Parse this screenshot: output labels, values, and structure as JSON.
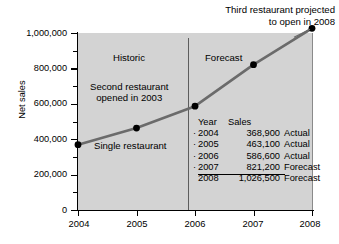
{
  "chart_data": {
    "type": "line",
    "title": "",
    "xlabel": "",
    "ylabel": "Net sales",
    "x": [
      "2004",
      "2005",
      "2006",
      "2007",
      "2008"
    ],
    "categories": [
      "2004",
      "2005",
      "2006",
      "2007",
      "2008"
    ],
    "values": [
      368900,
      463100,
      586600,
      821200,
      1026500
    ],
    "series": [
      {
        "name": "Net sales",
        "values": [
          368900,
          463100,
          586600,
          821200,
          1026500
        ]
      }
    ],
    "ylim": [
      0,
      1000000
    ],
    "y_ticks": [
      0,
      200000,
      400000,
      600000,
      800000,
      1000000
    ],
    "y_tick_labels": [
      "0",
      "200,000",
      "400,000",
      "600,000",
      "800,000",
      "1,000,000"
    ],
    "y_minor_tick_interval": 100000,
    "x_tick_labels": [
      "2004",
      "2005",
      "2006",
      "2007",
      "2008"
    ],
    "grid": false,
    "legend": "none",
    "marker": "filled-circle",
    "line_color": "#6b6b6b",
    "marker_color": "#000000",
    "plot_background": "#d3d3d3",
    "annotations": [
      {
        "text": "Historic",
        "x": "2004-2006 region"
      },
      {
        "text": "Forecast",
        "x": "2006-2008 region"
      },
      {
        "text": "Second restaurant opened in 2003",
        "x": "2005"
      },
      {
        "text": "Single restaurant",
        "x": "2005"
      },
      {
        "text": "Third restaurant projected to open in 2008",
        "x": "2008"
      }
    ],
    "divider_at": "2006"
  },
  "axis": {
    "y_title": "Net sales",
    "y_ticks": [
      {
        "label": "1,000,000",
        "value": 1000000
      },
      {
        "label": "800,000",
        "value": 800000
      },
      {
        "label": "600,000",
        "value": 600000
      },
      {
        "label": "400,000",
        "value": 400000
      },
      {
        "label": "200,000",
        "value": 200000
      },
      {
        "label": "0",
        "value": 0
      }
    ],
    "x_ticks": [
      {
        "label": "2004",
        "value": 2004
      },
      {
        "label": "2005",
        "value": 2005
      },
      {
        "label": "2006",
        "value": 2006
      },
      {
        "label": "2007",
        "value": 2007
      },
      {
        "label": "2008",
        "value": 2008
      }
    ]
  },
  "annotations": {
    "top_note_line1": "Third restaurant projected",
    "top_note_line2": "to open in 2008",
    "historic": "Historic",
    "forecast": "Forecast",
    "second_restaurant_line1": "Second restaurant",
    "second_restaurant_line2": "opened in 2003",
    "single_restaurant": "Single restaurant"
  },
  "table": {
    "headers": {
      "year": "Year",
      "sales": "Sales",
      "status": ""
    },
    "rows": [
      {
        "bullet": "·",
        "year": "2004",
        "sales": "368,900",
        "status": "Actual"
      },
      {
        "bullet": "·",
        "year": "2005",
        "sales": "463,100",
        "status": "Actual"
      },
      {
        "bullet": "·",
        "year": "2006",
        "sales": "586,600",
        "status": "Actual"
      },
      {
        "bullet": "·",
        "year": "2007",
        "sales": "821,200",
        "status": "Forecast"
      },
      {
        "bullet": "",
        "year": "2008",
        "sales": "1,026,500",
        "status": "Forecast"
      }
    ]
  }
}
